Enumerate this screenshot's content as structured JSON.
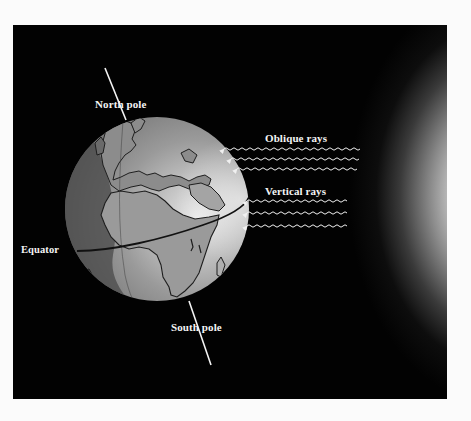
{
  "figure": {
    "type": "diagram",
    "colors": {
      "page_background": "#fbfbfb",
      "frame_background": "#020202",
      "label_color": "#f4f4f4",
      "globe_day": "#a8a8a8",
      "globe_night": "#5e5e5e",
      "land_outline": "#1e1e1e",
      "axis_line": "#f4f4f4",
      "sun_core": "#ffffff"
    },
    "labels": {
      "north_pole": "North pole",
      "south_pole": "South pole",
      "equator": "Equator",
      "oblique_rays": "Oblique rays",
      "vertical_rays": "Vertical rays"
    },
    "ray_groups": [
      {
        "name": "Oblique rays",
        "count": 3,
        "direction": "toward globe (left)",
        "strikes": "high latitude, northern hemisphere"
      },
      {
        "name": "Vertical rays",
        "count": 3,
        "direction": "toward globe (left)",
        "strikes": "near equator"
      }
    ],
    "elements": [
      "tilted Earth globe with Europe and Africa",
      "rotation axis through North and South poles",
      "equator line",
      "night-side shading (terminator)",
      "sun glow on right edge"
    ]
  }
}
